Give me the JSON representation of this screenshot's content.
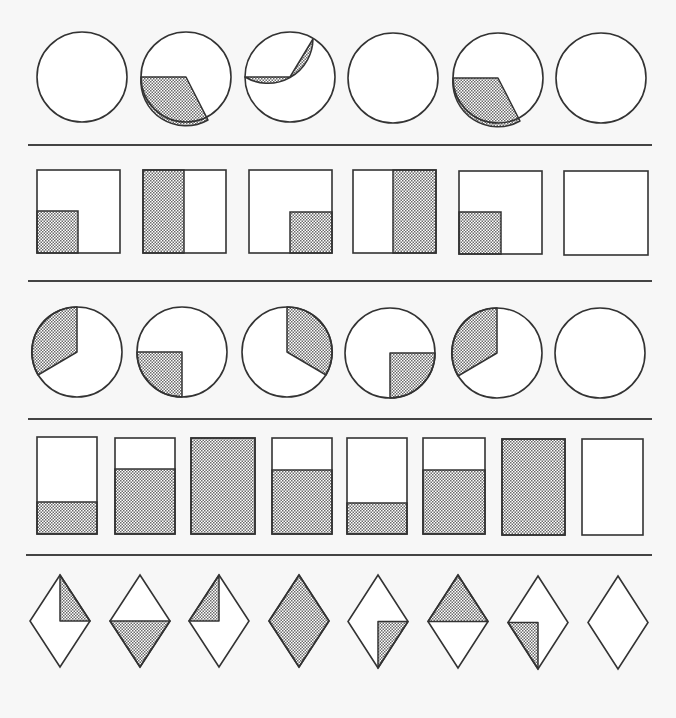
{
  "colors": {
    "background": "#f7f7f7",
    "stroke": "#333333",
    "shade_light": "#ffffff",
    "shade_dark": "#6a6a6a",
    "separator": "#444444"
  },
  "separators": [
    {
      "x1": 28,
      "x2": 652,
      "y": 145
    },
    {
      "x1": 28,
      "x2": 652,
      "y": 281
    },
    {
      "x1": 28,
      "x2": 652,
      "y": 419
    },
    {
      "x1": 26,
      "x2": 652,
      "y": 555
    }
  ],
  "rows": [
    {
      "name": "row-1-circles",
      "type": "circle",
      "items": [
        {
          "cx": 82,
          "cy": 77,
          "r": 45,
          "shade": null
        },
        {
          "cx": 186,
          "cy": 77,
          "r": 45,
          "shade": {
            "path": "M 141 77 L 186 77 L 208 120 A 45 45 0 0 1 141 77 Z"
          }
        },
        {
          "cx": 290,
          "cy": 77,
          "r": 45,
          "shade": {
            "path": "M 245 77 L 290 77 L 313 39 A 45 45 0 0 1 245 77 Z"
          }
        },
        {
          "cx": 393,
          "cy": 78,
          "r": 45,
          "shade": null
        },
        {
          "cx": 498,
          "cy": 78,
          "r": 45,
          "shade": {
            "path": "M 453 78 L 498 78 L 520 121 A 45 45 0 0 1 453 78 Z"
          }
        },
        {
          "cx": 601,
          "cy": 78,
          "r": 45,
          "shade": null
        }
      ]
    },
    {
      "name": "row-2-squares",
      "type": "square",
      "items": [
        {
          "x": 37,
          "y": 170,
          "w": 83,
          "h": 83,
          "shade": {
            "x": 37,
            "y": 211,
            "w": 41,
            "h": 42
          }
        },
        {
          "x": 143,
          "y": 170,
          "w": 83,
          "h": 83,
          "shade": {
            "x": 143,
            "y": 170,
            "w": 41,
            "h": 83
          }
        },
        {
          "x": 249,
          "y": 170,
          "w": 83,
          "h": 83,
          "shade": {
            "x": 290,
            "y": 212,
            "w": 42,
            "h": 41
          }
        },
        {
          "x": 353,
          "y": 170,
          "w": 83,
          "h": 83,
          "shade": {
            "x": 393,
            "y": 170,
            "w": 43,
            "h": 83
          }
        },
        {
          "x": 459,
          "y": 171,
          "w": 83,
          "h": 83,
          "shade": {
            "x": 459,
            "y": 212,
            "w": 42,
            "h": 42
          }
        },
        {
          "x": 564,
          "y": 171,
          "w": 84,
          "h": 84,
          "shade": null
        }
      ]
    },
    {
      "name": "row-3-circles",
      "type": "circle",
      "items": [
        {
          "cx": 77,
          "cy": 352,
          "r": 45,
          "shade": {
            "path": "M 77 352 L 77 307 A 45 45 0 0 0 38 375 Z"
          }
        },
        {
          "cx": 182,
          "cy": 352,
          "r": 45,
          "shade": {
            "path": "M 137 352 L 182 352 L 182 397 A 45 45 0 0 1 137 352 Z"
          }
        },
        {
          "cx": 287,
          "cy": 352,
          "r": 45,
          "shade": {
            "path": "M 287 352 L 287 307 A 45 45 0 0 1 326 375 Z"
          }
        },
        {
          "cx": 390,
          "cy": 353,
          "r": 45,
          "shade": {
            "path": "M 390 353 L 435 353 A 45 45 0 0 1 390 398 Z"
          }
        },
        {
          "cx": 497,
          "cy": 353,
          "r": 45,
          "shade": {
            "path": "M 497 353 L 497 308 A 45 45 0 0 0 458 376 Z"
          }
        },
        {
          "cx": 600,
          "cy": 353,
          "r": 45,
          "shade": null
        }
      ]
    },
    {
      "name": "row-4-rectangles",
      "type": "rect",
      "items": [
        {
          "x": 37,
          "y": 437,
          "w": 60,
          "h": 97,
          "fill_from_y": 502
        },
        {
          "x": 115,
          "y": 438,
          "w": 60,
          "h": 96,
          "fill_from_y": 469
        },
        {
          "x": 191,
          "y": 438,
          "w": 64,
          "h": 96,
          "fill_from_y": 438
        },
        {
          "x": 272,
          "y": 438,
          "w": 60,
          "h": 96,
          "fill_from_y": 470
        },
        {
          "x": 347,
          "y": 438,
          "w": 60,
          "h": 96,
          "fill_from_y": 503
        },
        {
          "x": 423,
          "y": 438,
          "w": 62,
          "h": 96,
          "fill_from_y": 470
        },
        {
          "x": 502,
          "y": 439,
          "w": 63,
          "h": 96,
          "fill_from_y": 439
        },
        {
          "x": 582,
          "y": 439,
          "w": 61,
          "h": 96,
          "fill_from_y": null
        }
      ]
    },
    {
      "name": "row-5-diamonds",
      "type": "diamond",
      "items": [
        {
          "cx": 60,
          "top": 575,
          "bottom": 667,
          "hw": 30,
          "shade": "top-right"
        },
        {
          "cx": 140,
          "top": 575,
          "bottom": 667,
          "hw": 30,
          "shade": "bottom-half"
        },
        {
          "cx": 219,
          "top": 575,
          "bottom": 667,
          "hw": 30,
          "shade": "top-left"
        },
        {
          "cx": 299,
          "top": 575,
          "bottom": 667,
          "hw": 30,
          "shade": "full"
        },
        {
          "cx": 378,
          "top": 575,
          "bottom": 668,
          "hw": 30,
          "shade": "bottom-right"
        },
        {
          "cx": 458,
          "top": 575,
          "bottom": 668,
          "hw": 30,
          "shade": "top-half"
        },
        {
          "cx": 538,
          "top": 576,
          "bottom": 669,
          "hw": 30,
          "shade": "bottom-left"
        },
        {
          "cx": 618,
          "top": 576,
          "bottom": 669,
          "hw": 30,
          "shade": null
        }
      ]
    }
  ]
}
